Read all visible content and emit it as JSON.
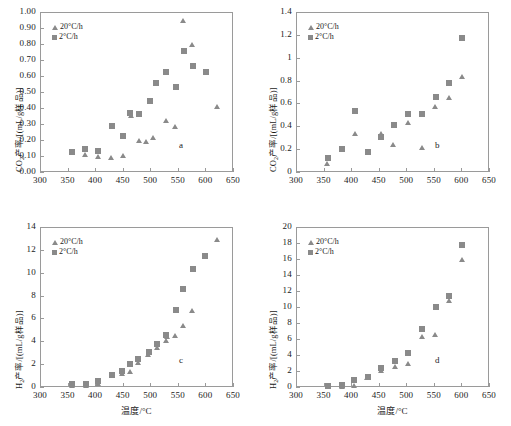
{
  "figure": {
    "layout": "2x2 grid of scatter plots",
    "marker_color": "#8a8a8a",
    "axis_color": "#9a9a9a",
    "legend_series": [
      {
        "name": "20°C/h",
        "marker": "triangle-up"
      },
      {
        "name": "2°C/h",
        "marker": "square"
      }
    ]
  },
  "axis_labels": {
    "x": "温度/°C",
    "y_co2": "CO2产率/[(mL/g样品)]",
    "y_h2": "H2产率/[(mL/g样品)]"
  },
  "chart_data": [
    {
      "type": "scatter",
      "panel": "a",
      "title": "",
      "xlabel": "",
      "ylabel": "CO2产率/[(mL/g样品)]",
      "xlim": [
        300,
        650
      ],
      "ylim": [
        0.0,
        1.0
      ],
      "xticks": [
        300,
        350,
        400,
        450,
        500,
        550,
        600,
        650
      ],
      "yticks": [
        "0.00",
        "0.10",
        "0.20",
        "0.30",
        "0.40",
        "0.50",
        "0.60",
        "0.70",
        "0.80",
        "0.90",
        "1.00"
      ],
      "grid": false,
      "legend_position": "top-left",
      "series": [
        {
          "name": "2°C/h",
          "marker": "square",
          "points": [
            [
              358,
              0.125
            ],
            [
              381,
              0.141
            ],
            [
              405,
              0.133
            ],
            [
              430,
              0.289
            ],
            [
              450,
              0.222
            ],
            [
              464,
              0.368
            ],
            [
              479,
              0.36
            ],
            [
              499,
              0.443
            ],
            [
              511,
              0.556
            ],
            [
              528,
              0.624
            ],
            [
              546,
              0.531
            ],
            [
              561,
              0.756
            ],
            [
              577,
              0.66
            ],
            [
              601,
              0.622
            ]
          ]
        },
        {
          "name": "20°C/h",
          "marker": "triangle",
          "points": [
            [
              382,
              0.108
            ],
            [
              405,
              0.098
            ],
            [
              430,
              0.092
            ],
            [
              451,
              0.105
            ],
            [
              465,
              0.355
            ],
            [
              479,
              0.2
            ],
            [
              492,
              0.19
            ],
            [
              506,
              0.215
            ],
            [
              528,
              0.32
            ],
            [
              546,
              0.285
            ],
            [
              560,
              0.948
            ],
            [
              576,
              0.8
            ],
            [
              621,
              0.408
            ]
          ]
        }
      ]
    },
    {
      "type": "scatter",
      "panel": "b",
      "title": "",
      "xlabel": "",
      "ylabel": "CO2产率/[(mL/g样品)]",
      "xlim": [
        300,
        650
      ],
      "ylim": [
        0,
        1.4
      ],
      "xticks": [
        300,
        350,
        400,
        450,
        500,
        550,
        600,
        650
      ],
      "yticks": [
        "0",
        "0.2",
        "0.4",
        "0.6",
        "0.8",
        "1",
        "1.2",
        "1.4"
      ],
      "grid": false,
      "legend_position": "top-left",
      "series": [
        {
          "name": "2°C/h",
          "marker": "square",
          "points": [
            [
              358,
              0.12
            ],
            [
              383,
              0.205
            ],
            [
              407,
              0.535
            ],
            [
              431,
              0.175
            ],
            [
              454,
              0.31
            ],
            [
              477,
              0.41
            ],
            [
              503,
              0.505
            ],
            [
              529,
              0.505
            ],
            [
              553,
              0.655
            ],
            [
              577,
              0.78
            ],
            [
              601,
              1.175
            ]
          ]
        },
        {
          "name": "20°C/h",
          "marker": "triangle",
          "points": [
            [
              357,
              0.075
            ],
            [
              383,
              0.197
            ],
            [
              407,
              0.335
            ],
            [
              431,
              0.17
            ],
            [
              454,
              0.335
            ],
            [
              477,
              0.243
            ],
            [
              503,
              0.435
            ],
            [
              529,
              0.218
            ],
            [
              553,
              0.575
            ],
            [
              577,
              0.655
            ],
            [
              601,
              0.832
            ]
          ]
        }
      ]
    },
    {
      "type": "scatter",
      "panel": "c",
      "title": "",
      "xlabel": "温度/°C",
      "ylabel": "H2产率/[(mL/g样品)]",
      "xlim": [
        300,
        650
      ],
      "ylim": [
        0,
        14
      ],
      "xticks": [
        300,
        350,
        400,
        450,
        500,
        550,
        600,
        650
      ],
      "yticks": [
        "0",
        "2",
        "4",
        "6",
        "8",
        "10",
        "12",
        "14"
      ],
      "grid": false,
      "legend_position": "top-left",
      "series": [
        {
          "name": "2°C/h",
          "marker": "square",
          "points": [
            [
              358,
              0.3
            ],
            [
              383,
              0.28
            ],
            [
              406,
              0.52
            ],
            [
              430,
              1.05
            ],
            [
              448,
              1.42
            ],
            [
              464,
              2.02
            ],
            [
              478,
              2.42
            ],
            [
              497,
              3.02
            ],
            [
              513,
              3.78
            ],
            [
              529,
              4.55
            ],
            [
              546,
              6.75
            ],
            [
              560,
              8.55
            ],
            [
              578,
              10.3
            ],
            [
              600,
              11.45
            ]
          ]
        },
        {
          "name": "20°C/h",
          "marker": "triangle",
          "points": [
            [
              358,
              0.12
            ],
            [
              383,
              0.15
            ],
            [
              406,
              0.28
            ],
            [
              431,
              0.98
            ],
            [
              449,
              1.15
            ],
            [
              464,
              1.35
            ],
            [
              478,
              2.12
            ],
            [
              497,
              2.82
            ],
            [
              513,
              3.42
            ],
            [
              529,
              4.08
            ],
            [
              531,
              4.45
            ],
            [
              546,
              4.55
            ],
            [
              559,
              5.38
            ],
            [
              576,
              6.7
            ],
            [
              621,
              12.95
            ]
          ]
        }
      ]
    },
    {
      "type": "scatter",
      "panel": "d",
      "title": "",
      "xlabel": "温度/°C",
      "ylabel": "H2产率/[(mL/g样品)]",
      "xlim": [
        300,
        650
      ],
      "ylim": [
        0,
        20
      ],
      "xticks": [
        300,
        350,
        400,
        450,
        500,
        550,
        600,
        650
      ],
      "yticks": [
        "0",
        "2",
        "4",
        "6",
        "8",
        "10",
        "12",
        "14",
        "16",
        "18",
        "20"
      ],
      "grid": false,
      "legend_position": "top-left",
      "series": [
        {
          "name": "2°C/h",
          "marker": "square",
          "points": [
            [
              358,
              0.12
            ],
            [
              383,
              0.25
            ],
            [
              406,
              0.88
            ],
            [
              430,
              1.25
            ],
            [
              455,
              2.42
            ],
            [
              479,
              3.25
            ],
            [
              504,
              4.3
            ],
            [
              529,
              7.3
            ],
            [
              553,
              10.0
            ],
            [
              577,
              11.35
            ],
            [
              601,
              17.8
            ]
          ]
        },
        {
          "name": "20°C/h",
          "marker": "triangle",
          "points": [
            [
              358,
              0.05
            ],
            [
              383,
              0.12
            ],
            [
              406,
              0.2
            ],
            [
              430,
              1.15
            ],
            [
              455,
              2.1
            ],
            [
              479,
              2.62
            ],
            [
              504,
              2.92
            ],
            [
              529,
              6.3
            ],
            [
              553,
              6.62
            ],
            [
              577,
              10.85
            ],
            [
              601,
              15.95
            ]
          ]
        }
      ]
    }
  ],
  "panels": {
    "a": {
      "letter": "a"
    },
    "b": {
      "letter": "b"
    },
    "c": {
      "letter": "c"
    },
    "d": {
      "letter": "d"
    }
  }
}
